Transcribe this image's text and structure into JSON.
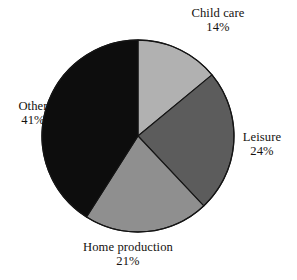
{
  "chart_data": {
    "type": "pie",
    "title": "",
    "subtitle": "",
    "xlabel": "",
    "ylabel": "",
    "grid": false,
    "legend": "none",
    "labels_position": "outside",
    "start_angle_deg": 0,
    "direction": "clockwise",
    "total": 100,
    "units": "%",
    "categories": [
      "Child care",
      "Leisure",
      "Home production",
      "Other"
    ],
    "values": [
      14,
      24,
      21,
      41
    ],
    "colors": [
      "#b1b1b1",
      "#5c5c5c",
      "#8f8f8f",
      "#0d0d0d"
    ],
    "slices": [
      {
        "name": "Child care",
        "value": 14,
        "value_text": "14%",
        "color": "#b1b1b1",
        "start_deg": 0,
        "end_deg": 50.4
      },
      {
        "name": "Leisure",
        "value": 24,
        "value_text": "24%",
        "color": "#5c5c5c",
        "start_deg": 50.4,
        "end_deg": 136.8
      },
      {
        "name": "Home production",
        "value": 21,
        "value_text": "21%",
        "color": "#8f8f8f",
        "start_deg": 136.8,
        "end_deg": 212.4
      },
      {
        "name": "Other",
        "value": 41,
        "value_text": "41%",
        "color": "#0d0d0d",
        "start_deg": 212.4,
        "end_deg": 360
      }
    ]
  },
  "labels": {
    "child_care": {
      "name": "Child care",
      "value": "14%"
    },
    "leisure": {
      "name": "Leisure",
      "value": "24%"
    },
    "home_production": {
      "name": "Home production",
      "value": "21%"
    },
    "other": {
      "name": "Other",
      "value": "41%"
    }
  },
  "style": {
    "background": "#ffffff",
    "outline": "#151515",
    "text_color": "#15120f"
  },
  "geometry": {
    "center_x": 138,
    "center_y": 136,
    "radius": 96
  }
}
